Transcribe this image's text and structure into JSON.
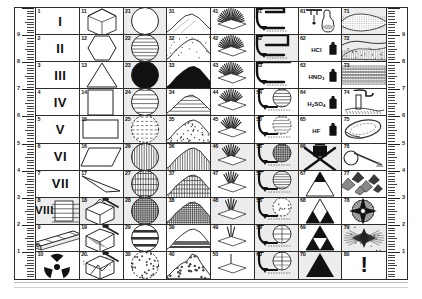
{
  "plate": {
    "title": "Geotechnical symbol legend plate",
    "columns": 8,
    "rows": 10,
    "total_cells": 80
  },
  "ruler": {
    "labels": [
      "9",
      "8",
      "7",
      "6",
      "5",
      "4",
      "3",
      "2",
      "1"
    ],
    "orientation": "vertical",
    "left_label_position": "inner",
    "right_label_position": "inner"
  },
  "cells": [
    {
      "n": "1",
      "kind": "roman",
      "text": "I",
      "shaded": false
    },
    {
      "n": "2",
      "kind": "roman",
      "text": "II",
      "shaded": false
    },
    {
      "n": "3",
      "kind": "roman",
      "text": "III",
      "shaded": false
    },
    {
      "n": "4",
      "kind": "roman",
      "text": "IV",
      "shaded": false
    },
    {
      "n": "5",
      "kind": "roman",
      "text": "V",
      "shaded": false
    },
    {
      "n": "6",
      "kind": "roman",
      "text": "VI",
      "shaded": false
    },
    {
      "n": "7",
      "kind": "roman",
      "text": "VII",
      "shaded": false
    },
    {
      "n": "8",
      "kind": "roman8",
      "text": "VIII",
      "shaded": true
    },
    {
      "n": "9",
      "kind": "corebox",
      "text": "",
      "shaded": false
    },
    {
      "n": "10",
      "kind": "radiation",
      "text": "",
      "shaded": false
    },
    {
      "n": "11",
      "kind": "cube",
      "text": "",
      "shaded": false
    },
    {
      "n": "12",
      "kind": "hexagon",
      "text": "",
      "shaded": false
    },
    {
      "n": "13",
      "kind": "triangle-outline",
      "text": "",
      "shaded": false
    },
    {
      "n": "14",
      "kind": "square",
      "text": "",
      "shaded": false
    },
    {
      "n": "15",
      "kind": "rect",
      "text": "",
      "shaded": false
    },
    {
      "n": "16",
      "kind": "parallelogram",
      "text": "",
      "shaded": false
    },
    {
      "n": "17",
      "kind": "wedge",
      "text": "",
      "shaded": false
    },
    {
      "n": "18",
      "kind": "block-hammer-1",
      "text": "",
      "shaded": true
    },
    {
      "n": "19",
      "kind": "block-hammer-2",
      "text": "",
      "shaded": false
    },
    {
      "n": "20",
      "kind": "block-hammer-3",
      "text": "",
      "shaded": false
    },
    {
      "n": "21",
      "kind": "circle-plain",
      "text": "",
      "shaded": true
    },
    {
      "n": "22",
      "kind": "circle-hlines",
      "text": "",
      "shaded": true
    },
    {
      "n": "23",
      "kind": "circle-solid",
      "text": "",
      "shaded": true
    },
    {
      "n": "24",
      "kind": "circle-hlines-2",
      "text": "",
      "shaded": true
    },
    {
      "n": "25",
      "kind": "circle-dash",
      "text": "",
      "shaded": true
    },
    {
      "n": "26",
      "kind": "circle-vlines",
      "text": "",
      "shaded": true
    },
    {
      "n": "27",
      "kind": "circle-cross",
      "text": "",
      "shaded": true
    },
    {
      "n": "28",
      "kind": "circle-grid",
      "text": "",
      "shaded": true
    },
    {
      "n": "29",
      "kind": "circle-hband",
      "text": "",
      "shaded": false
    },
    {
      "n": "30",
      "kind": "circle-speckle",
      "text": "",
      "shaded": false
    },
    {
      "n": "31",
      "kind": "hill-smooth",
      "text": "",
      "shaded": false
    },
    {
      "n": "32",
      "kind": "hill-rough",
      "text": "",
      "shaded": false
    },
    {
      "n": "33",
      "kind": "hill-solid",
      "text": "",
      "shaded": false
    },
    {
      "n": "34",
      "kind": "hill-lines",
      "text": "",
      "shaded": false
    },
    {
      "n": "35",
      "kind": "hill-stipple",
      "text": "",
      "shaded": false
    },
    {
      "n": "36",
      "kind": "hill-vlines",
      "text": "",
      "shaded": false
    },
    {
      "n": "37",
      "kind": "hill-grid",
      "text": "",
      "shaded": false
    },
    {
      "n": "38",
      "kind": "hill-mesh",
      "text": "",
      "shaded": false
    },
    {
      "n": "39",
      "kind": "hill-band",
      "text": "",
      "shaded": false
    },
    {
      "n": "40",
      "kind": "hill-rubble",
      "text": "",
      "shaded": false
    },
    {
      "n": "41",
      "kind": "fan-9",
      "text": "",
      "shaded": false
    },
    {
      "n": "42",
      "kind": "fan-8",
      "text": "",
      "shaded": false
    },
    {
      "n": "43",
      "kind": "fan-7",
      "text": "",
      "shaded": false
    },
    {
      "n": "44",
      "kind": "fan-6",
      "text": "",
      "shaded": false
    },
    {
      "n": "45",
      "kind": "fan-5",
      "text": "",
      "shaded": false
    },
    {
      "n": "46",
      "kind": "fan-4",
      "text": "",
      "shaded": true
    },
    {
      "n": "47",
      "kind": "fan-3",
      "text": "",
      "shaded": false
    },
    {
      "n": "48",
      "kind": "fan-2",
      "text": "",
      "shaded": true
    },
    {
      "n": "49",
      "kind": "fan-1",
      "text": "",
      "shaded": false
    },
    {
      "n": "50",
      "kind": "fan-0",
      "text": "",
      "shaded": false
    },
    {
      "n": "51",
      "kind": "bore-plain",
      "text": "",
      "shaded": false
    },
    {
      "n": "52",
      "kind": "bore-plain-2",
      "text": "",
      "shaded": true
    },
    {
      "n": "53",
      "kind": "bore-plain-3",
      "text": "",
      "shaded": false
    },
    {
      "n": "54",
      "kind": "bore-circ-h",
      "text": "",
      "shaded": false
    },
    {
      "n": "55",
      "kind": "bore-circ-d",
      "text": "",
      "shaded": false
    },
    {
      "n": "56",
      "kind": "bore-circ-grid",
      "text": "",
      "shaded": true
    },
    {
      "n": "57",
      "kind": "bore-circ-hl",
      "text": "",
      "shaded": true
    },
    {
      "n": "58",
      "kind": "bore-circ-sp",
      "text": "",
      "shaded": true
    },
    {
      "n": "59",
      "kind": "bore-circ-q",
      "text": "",
      "shaded": true
    },
    {
      "n": "60",
      "kind": "bore-circ-q2",
      "text": "",
      "shaded": true
    },
    {
      "n": "61",
      "kind": "dropper",
      "text": "",
      "shaded": false
    },
    {
      "n": "62",
      "kind": "acid",
      "text": "HCl",
      "shaded": false
    },
    {
      "n": "63",
      "kind": "acid",
      "text": "HNO3",
      "shaded": false
    },
    {
      "n": "64",
      "kind": "acid",
      "text": "H2SO4",
      "shaded": false
    },
    {
      "n": "65",
      "kind": "acid",
      "text": "HF",
      "shaded": false
    },
    {
      "n": "66",
      "kind": "acid-cross",
      "text": "",
      "shaded": true
    },
    {
      "n": "67",
      "kind": "tri-1",
      "text": "",
      "shaded": false
    },
    {
      "n": "68",
      "kind": "tri-2",
      "text": "",
      "shaded": false
    },
    {
      "n": "69",
      "kind": "tri-3",
      "text": "",
      "shaded": false
    },
    {
      "n": "70",
      "kind": "tri-4",
      "text": "",
      "shaded": true
    },
    {
      "n": "71",
      "kind": "strata-1",
      "text": "",
      "shaded": true
    },
    {
      "n": "72",
      "kind": "strata-2",
      "text": "",
      "shaded": true
    },
    {
      "n": "73",
      "kind": "strata-3",
      "text": "",
      "shaded": false
    },
    {
      "n": "74",
      "kind": "waterfall",
      "text": "",
      "shaded": false
    },
    {
      "n": "75",
      "kind": "loop",
      "text": "",
      "shaded": false
    },
    {
      "n": "76",
      "kind": "hook",
      "text": "",
      "shaded": false
    },
    {
      "n": "77",
      "kind": "shards",
      "text": "",
      "shaded": false
    },
    {
      "n": "78",
      "kind": "compass",
      "text": "",
      "shaded": false
    },
    {
      "n": "79",
      "kind": "burst",
      "text": "",
      "shaded": true
    },
    {
      "n": "80",
      "kind": "exclaim",
      "text": "!",
      "shaded": false
    }
  ],
  "colors": {
    "ink": "#1a1a1a",
    "rule": "#2c2c2c",
    "shade": "#ececec",
    "paper": "#ffffff"
  }
}
